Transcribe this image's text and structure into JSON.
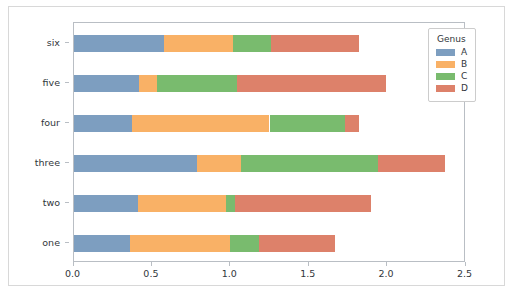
{
  "chart_data": {
    "type": "bar",
    "orientation": "horizontal",
    "stacked": true,
    "title": "",
    "xlabel": "",
    "ylabel": "",
    "xlim": [
      0.0,
      2.5
    ],
    "xticks": [
      "0.0",
      "0.5",
      "1.0",
      "1.5",
      "2.0",
      "2.5"
    ],
    "xtick_values": [
      0.0,
      0.5,
      1.0,
      1.5,
      2.0,
      2.5
    ],
    "grid": false,
    "categories": [
      "six",
      "five",
      "four",
      "three",
      "two",
      "one"
    ],
    "series": [
      {
        "name": "A",
        "color": "#7d9ec0",
        "values": [
          0.58,
          0.42,
          0.37,
          0.79,
          0.41,
          0.36
        ]
      },
      {
        "name": "B",
        "color": "#f9b166",
        "values": [
          0.44,
          0.11,
          0.88,
          0.28,
          0.56,
          0.64
        ]
      },
      {
        "name": "C",
        "color": "#79bb6e",
        "values": [
          0.24,
          0.51,
          0.48,
          0.87,
          0.06,
          0.18
        ]
      },
      {
        "name": "D",
        "color": "#dd816a",
        "values": [
          0.56,
          0.95,
          0.09,
          0.43,
          0.87,
          0.49
        ]
      }
    ],
    "totals": [
      1.82,
      1.99,
      1.82,
      2.37,
      1.9,
      1.66
    ],
    "legend": {
      "title": "Genus",
      "position": "upper right outside",
      "entries": [
        {
          "label": "A",
          "color": "#7d9ec0"
        },
        {
          "label": "B",
          "color": "#f9b166"
        },
        {
          "label": "C",
          "color": "#79bb6e"
        },
        {
          "label": "D",
          "color": "#dd816a"
        }
      ]
    },
    "background_color": "#ffffff",
    "axes_edge_color": "#b9bec4"
  }
}
